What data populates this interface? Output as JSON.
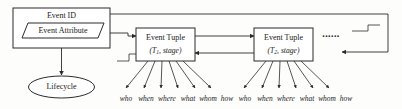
{
  "diagram": {
    "colors": {
      "stroke": "#2b2b2b",
      "fill": "#ffffff",
      "background": "#fdfdfc",
      "text": "#1a1a1a"
    },
    "nodes": {
      "event_id": {
        "label": "Event ID",
        "shape": "rectangle"
      },
      "event_attribute": {
        "label": "Event Attribute",
        "shape": "parallelogram"
      },
      "lifecycle": {
        "label": "Lifecycle",
        "shape": "ellipse"
      },
      "event_tuple_1": {
        "label": "Event Tuple",
        "sublabel": "(T1, stage)",
        "sub_base": "(T",
        "sub_index": "1",
        "sub_tail": ", stage)",
        "shape": "rectangle"
      },
      "event_tuple_2": {
        "label": "Event Tuple",
        "sublabel": "(T2, stage)",
        "sub_base": "(T",
        "sub_index": "2",
        "sub_tail": ", stage)",
        "shape": "rectangle"
      },
      "continuation": {
        "label": "......",
        "shape": "ellipsis"
      }
    },
    "attribute_labels_group_1": [
      "who",
      "when",
      "where",
      "what",
      "whom",
      "how"
    ],
    "attribute_labels_group_2": [
      "who",
      "when",
      "where",
      "what",
      "whom",
      "how"
    ]
  }
}
